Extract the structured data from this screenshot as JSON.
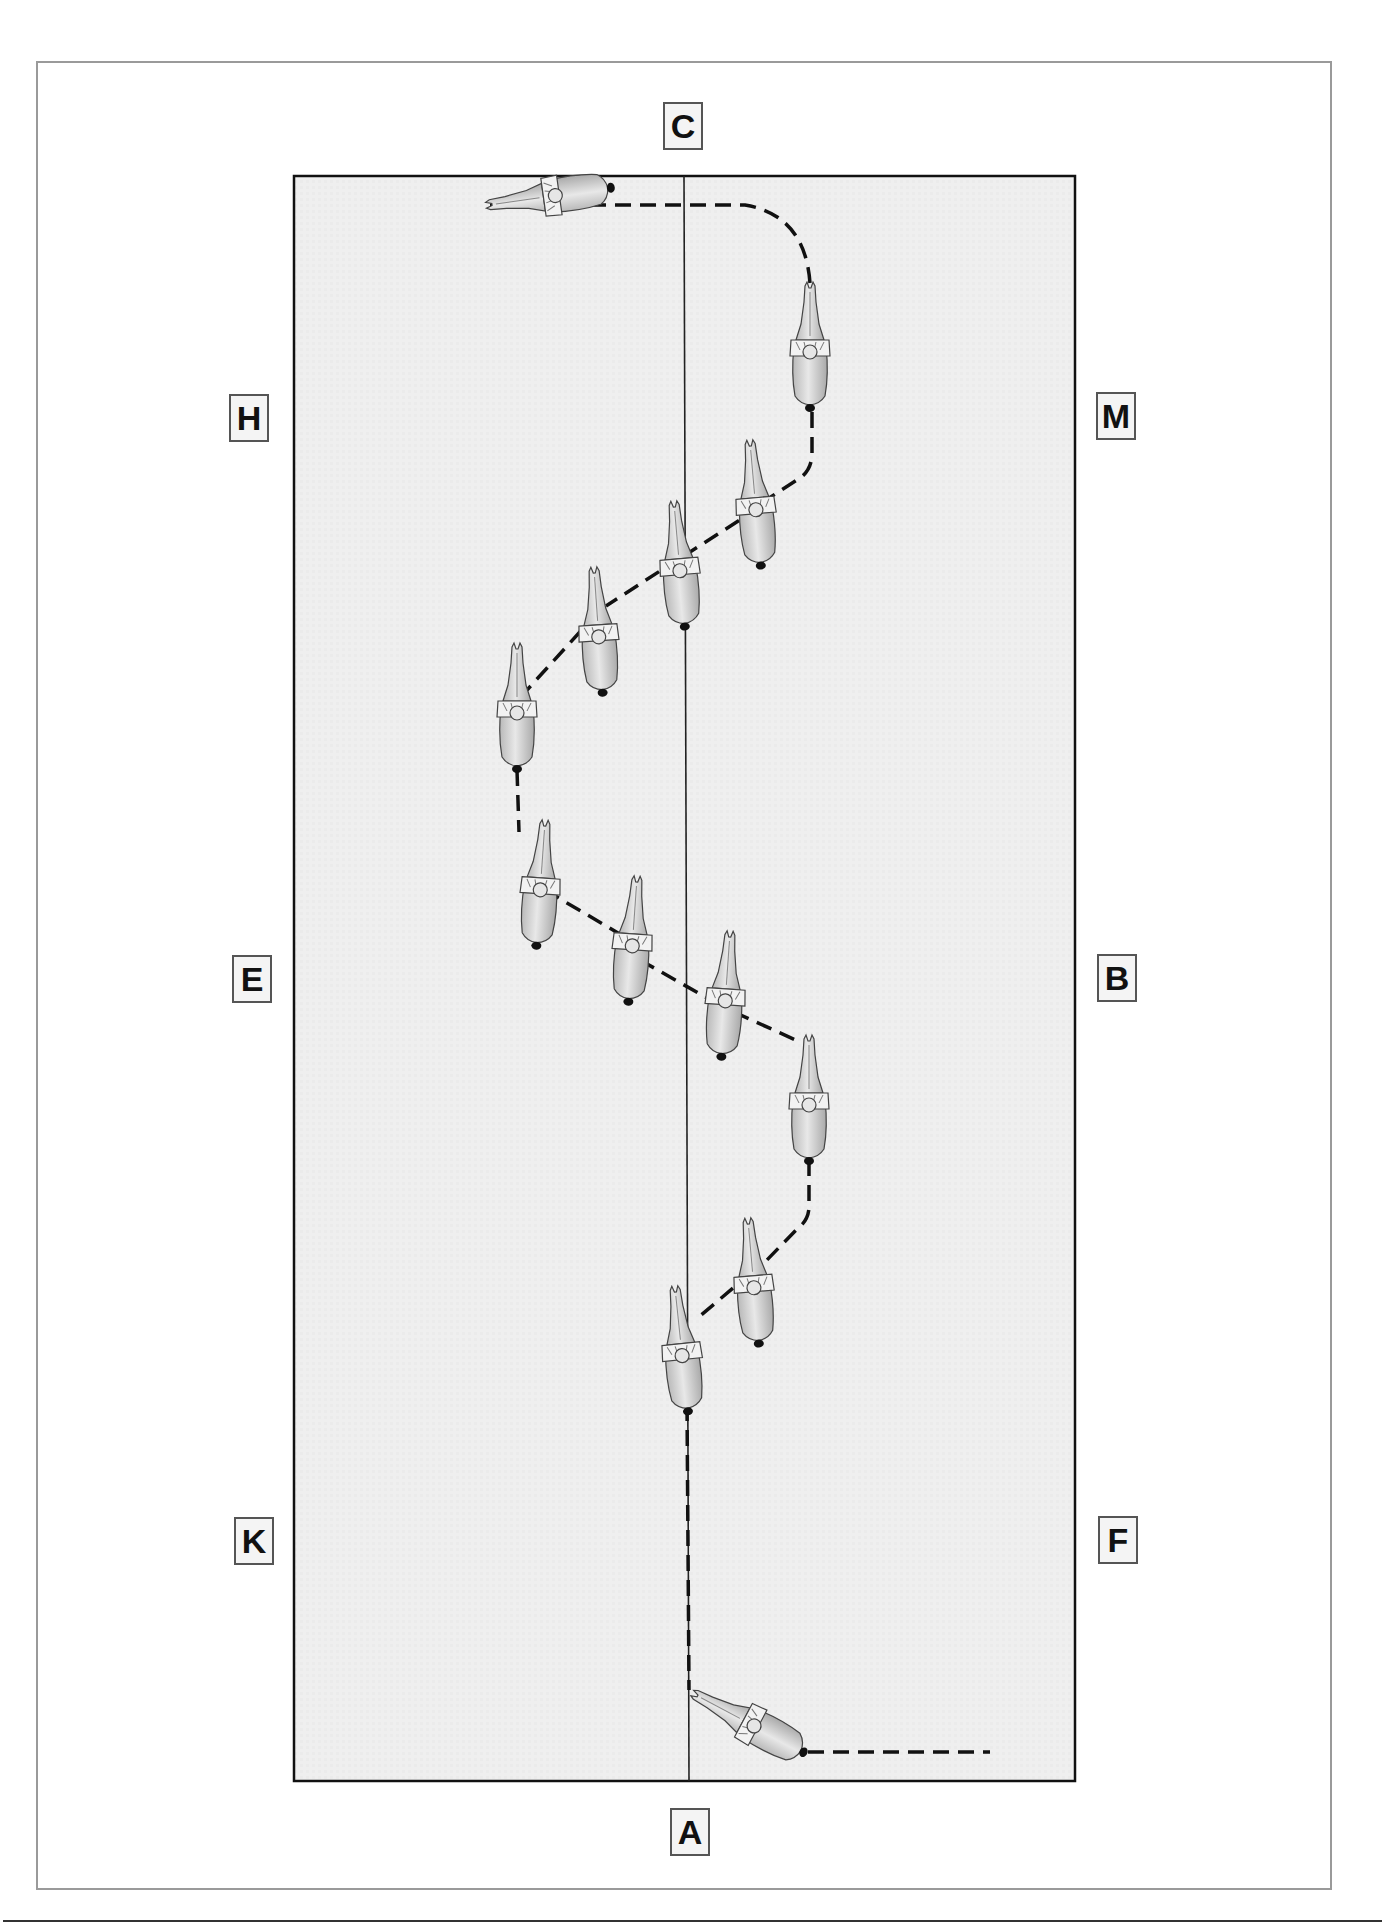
{
  "diagram": {
    "type": "dressage-arena-movement",
    "arena": {
      "fill_color": "#efefef",
      "border_color": "#111111",
      "centerline_color": "#222222"
    },
    "markers": [
      {
        "id": "C",
        "label": "C",
        "position": "top-center"
      },
      {
        "id": "H",
        "label": "H",
        "position": "left-upper"
      },
      {
        "id": "M",
        "label": "M",
        "position": "right-upper"
      },
      {
        "id": "E",
        "label": "E",
        "position": "left-middle"
      },
      {
        "id": "B",
        "label": "B",
        "position": "right-middle"
      },
      {
        "id": "K",
        "label": "K",
        "position": "left-lower"
      },
      {
        "id": "F",
        "label": "F",
        "position": "right-lower"
      },
      {
        "id": "A",
        "label": "A",
        "position": "bottom-center"
      }
    ],
    "path": {
      "style": "dashed",
      "color": "#111111",
      "description": "Horse and rider path: along the short side at C, turn down the right track past M, half-pass zig-zag left to the E side, then zig-zag back right toward B, then half-pass to the centerline and proceed down the centerline to A, turning right along the short side."
    },
    "horse_count": 13
  }
}
